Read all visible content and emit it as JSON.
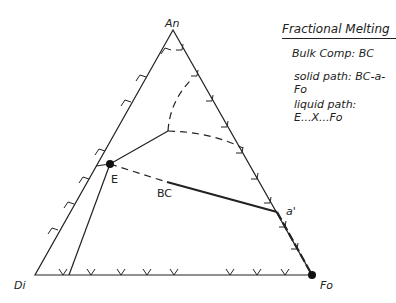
{
  "diagram": {
    "vertices": {
      "top": "An",
      "left": "Di",
      "right": "Fo"
    },
    "points": {
      "eutectic": "E",
      "bulk": "BC",
      "a_prime": "a'"
    }
  },
  "legend": {
    "title": "Fractional Melting",
    "bulk": "Bulk Comp: BC",
    "solid_path": "solid path: BC-a-Fo",
    "liquid_path": "liquid path: E...X...Fo"
  }
}
